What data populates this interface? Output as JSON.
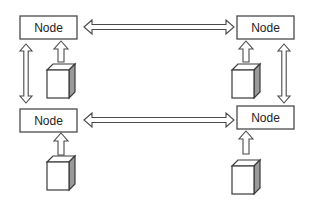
{
  "diagram": {
    "title": "",
    "nodes": [
      {
        "id": "top-left",
        "label": "Node"
      },
      {
        "id": "top-right",
        "label": "Node"
      },
      {
        "id": "bottom-left",
        "label": "Node"
      },
      {
        "id": "bottom-right",
        "label": "Node"
      }
    ],
    "edges": [
      {
        "from": "top-left",
        "to": "top-right",
        "type": "bidirectional"
      },
      {
        "from": "bottom-left",
        "to": "bottom-right",
        "type": "bidirectional"
      },
      {
        "from": "top-left",
        "to": "bottom-left",
        "type": "bidirectional"
      },
      {
        "from": "top-right",
        "to": "bottom-right",
        "type": "bidirectional"
      }
    ],
    "devices": [
      {
        "id": "cube-top-left",
        "feeds": "top-left",
        "icon": "cube-icon"
      },
      {
        "id": "cube-top-right",
        "feeds": "top-right",
        "icon": "cube-icon"
      },
      {
        "id": "cube-bottom-left",
        "feeds": "bottom-left",
        "icon": "cube-icon"
      },
      {
        "id": "cube-bottom-right",
        "feeds": "bottom-right",
        "icon": "cube-icon"
      }
    ],
    "colors": {
      "stroke": "#4a4a4a",
      "cube_side": "#9a9a9a",
      "background": "#ffffff"
    }
  }
}
